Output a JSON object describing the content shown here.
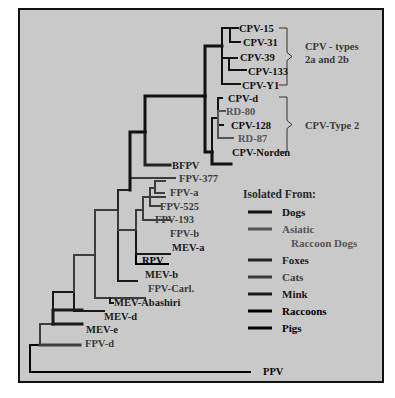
{
  "figure": {
    "panel": {
      "x": 19,
      "y": 9,
      "w": 364,
      "h": 373,
      "fill": "#c9c9c9"
    },
    "colors": {
      "dogs": "#111111",
      "asiatic_raccoon_dogs": "#555555",
      "foxes": "#222222",
      "cats": "#3c3c3c",
      "mink": "#1a1a1a",
      "raccoons": "#000000",
      "pigs": "#050505"
    }
  },
  "tree": {
    "branches": [
      {
        "d": "M30 372 H250",
        "host": "pigs",
        "w": 2
      },
      {
        "d": "M30 372 V345 H40",
        "host": "pigs",
        "w": 2
      },
      {
        "d": "M40 345 H80",
        "host": "cats",
        "w": 3
      },
      {
        "d": "M40 345 V324 H53",
        "host": "cats",
        "w": 2
      },
      {
        "d": "M53 324 H82",
        "host": "mink",
        "w": 3
      },
      {
        "d": "M53 324 V310 H82",
        "host": "mink",
        "w": 3
      },
      {
        "d": "M53 310 V292 H74",
        "host": "mink",
        "w": 2
      },
      {
        "d": "M74 292 V311 H104",
        "host": "mink",
        "w": 2
      },
      {
        "d": "M74 292 V255 H95",
        "host": "cats",
        "w": 2
      },
      {
        "d": "M95 255 V298 H110",
        "host": "cats",
        "w": 2
      },
      {
        "d": "M110 298 H145",
        "host": "cats",
        "w": 2
      },
      {
        "d": "M110 298 V303 H113",
        "host": "mink",
        "w": 2
      },
      {
        "d": "M95 255 V210 H118",
        "host": "cats",
        "w": 2
      },
      {
        "d": "M118 210 V281 H137",
        "host": "mink",
        "w": 2
      },
      {
        "d": "M118 210 V230 H136",
        "host": "cats",
        "w": 2
      },
      {
        "d": "M136 230 V264 H168",
        "host": "raccoons",
        "w": 2
      },
      {
        "d": "M136 230 V254 H170",
        "host": "mink",
        "w": 2
      },
      {
        "d": "M136 230 V210 H143",
        "host": "cats",
        "w": 2
      },
      {
        "d": "M143 210 V220 H170",
        "host": "cats",
        "w": 2
      },
      {
        "d": "M143 210 V197 H150",
        "host": "cats",
        "w": 2
      },
      {
        "d": "M150 197 H165",
        "host": "cats",
        "w": 2
      },
      {
        "d": "M150 197 V206 H160",
        "host": "cats",
        "w": 2
      },
      {
        "d": "M150 197 V188 H155",
        "host": "cats",
        "w": 2
      },
      {
        "d": "M155 188 V181 H165",
        "host": "cats",
        "w": 2
      },
      {
        "d": "M155 188 V193 H164",
        "host": "cats",
        "w": 2
      },
      {
        "d": "M118 210 V190 H130",
        "host": "foxes",
        "w": 2
      },
      {
        "d": "M130 190 V178 H175",
        "host": "cats",
        "w": 2
      },
      {
        "d": "M130 190 V132 H145",
        "host": "dogs",
        "w": 3
      },
      {
        "d": "M145 132 V165 H170",
        "host": "foxes",
        "w": 3
      },
      {
        "d": "M145 132 V96 H205",
        "host": "dogs",
        "w": 3
      },
      {
        "d": "M205 96 V46 H222",
        "host": "dogs",
        "w": 3
      },
      {
        "d": "M222 46 V28 H230",
        "host": "dogs",
        "w": 2
      },
      {
        "d": "M230 28 H238",
        "host": "dogs",
        "w": 2
      },
      {
        "d": "M230 28 V42 H240",
        "host": "dogs",
        "w": 2
      },
      {
        "d": "M222 46 V58 H229",
        "host": "dogs",
        "w": 2
      },
      {
        "d": "M229 58 H237",
        "host": "dogs",
        "w": 2
      },
      {
        "d": "M229 58 V70 H246",
        "host": "dogs",
        "w": 2
      },
      {
        "d": "M222 46 V84 H240",
        "host": "dogs",
        "w": 2
      },
      {
        "d": "M205 96 V152 H212",
        "host": "dogs",
        "w": 3
      },
      {
        "d": "M212 152 V164 H231",
        "host": "dogs",
        "w": 3
      },
      {
        "d": "M212 152 V118 H218",
        "host": "dogs",
        "w": 2
      },
      {
        "d": "M218 118 V98 H222",
        "host": "dogs",
        "w": 2
      },
      {
        "d": "M218 118 V111 H225",
        "host": "asiatic_raccoon_dogs",
        "w": 2
      },
      {
        "d": "M218 118 V125 H223",
        "host": "dogs",
        "w": 2
      },
      {
        "d": "M218 118 V138 H233",
        "host": "asiatic_raccoon_dogs",
        "w": 2
      }
    ],
    "leaves": [
      {
        "label": "CPV-15",
        "x": 239,
        "y": 32,
        "host": "dogs"
      },
      {
        "label": "CPV-31",
        "x": 243,
        "y": 46,
        "host": "dogs"
      },
      {
        "label": "CPV-39",
        "x": 240,
        "y": 61,
        "host": "dogs"
      },
      {
        "label": "CPV-133",
        "x": 248,
        "y": 75,
        "host": "dogs"
      },
      {
        "label": "CPV-Y1",
        "x": 242,
        "y": 89,
        "host": "dogs"
      },
      {
        "label": "CPV-d",
        "x": 228,
        "y": 102,
        "host": "dogs"
      },
      {
        "label": "RD-80",
        "x": 226,
        "y": 115,
        "host": "asiatic_raccoon_dogs"
      },
      {
        "label": "CPV-128",
        "x": 231,
        "y": 129,
        "host": "dogs"
      },
      {
        "label": "RD-87",
        "x": 238,
        "y": 142,
        "host": "asiatic_raccoon_dogs"
      },
      {
        "label": "CPV-Norden",
        "x": 232,
        "y": 156,
        "host": "dogs"
      },
      {
        "label": "BFPV",
        "x": 172,
        "y": 169,
        "host": "foxes"
      },
      {
        "label": "FPV-377",
        "x": 179,
        "y": 182,
        "host": "cats"
      },
      {
        "label": "FPV-a",
        "x": 170,
        "y": 196,
        "host": "cats"
      },
      {
        "label": "FPV-525",
        "x": 160,
        "y": 210,
        "host": "cats"
      },
      {
        "label": "FPV-193",
        "x": 155,
        "y": 223,
        "host": "cats"
      },
      {
        "label": "FPV-b",
        "x": 170,
        "y": 237,
        "host": "cats"
      },
      {
        "label": "MEV-a",
        "x": 172,
        "y": 251,
        "host": "mink"
      },
      {
        "label": "RPV",
        "x": 142,
        "y": 264,
        "host": "raccoons"
      },
      {
        "label": "MEV-b",
        "x": 145,
        "y": 278,
        "host": "mink"
      },
      {
        "label": "FPV-Carl.",
        "x": 148,
        "y": 292,
        "host": "cats"
      },
      {
        "label": "MEV-Abashiri",
        "x": 114,
        "y": 306,
        "host": "mink"
      },
      {
        "label": "MEV-d",
        "x": 104,
        "y": 320,
        "host": "mink"
      },
      {
        "label": "MEV-e",
        "x": 86,
        "y": 333,
        "host": "mink"
      },
      {
        "label": "FPV-d",
        "x": 85,
        "y": 347,
        "host": "cats"
      },
      {
        "label": "PPV",
        "x": 263,
        "y": 375,
        "host": "pigs"
      }
    ],
    "groups": [
      {
        "label_lines": [
          "CPV - types",
          "2a  and 2b"
        ],
        "bracket": {
          "x": 287,
          "y1": 28,
          "y2": 85
        },
        "text_x": 305,
        "text_y": 50
      },
      {
        "label_lines": [
          "CPV-Type 2"
        ],
        "bracket": {
          "x": 287,
          "y1": 97,
          "y2": 152
        },
        "text_x": 305,
        "text_y": 129
      }
    ]
  },
  "legend": {
    "title": "Isolated From:",
    "items": [
      {
        "label": "Dogs",
        "host": "dogs"
      },
      {
        "label": "Asiatic",
        "label2": "Raccoon Dogs",
        "host": "asiatic_raccoon_dogs"
      },
      {
        "label": "Foxes",
        "host": "foxes"
      },
      {
        "label": "Cats",
        "host": "cats"
      },
      {
        "label": "Mink",
        "host": "mink"
      },
      {
        "label": "Raccoons",
        "host": "raccoons"
      },
      {
        "label": "Pigs",
        "host": "pigs"
      }
    ]
  }
}
